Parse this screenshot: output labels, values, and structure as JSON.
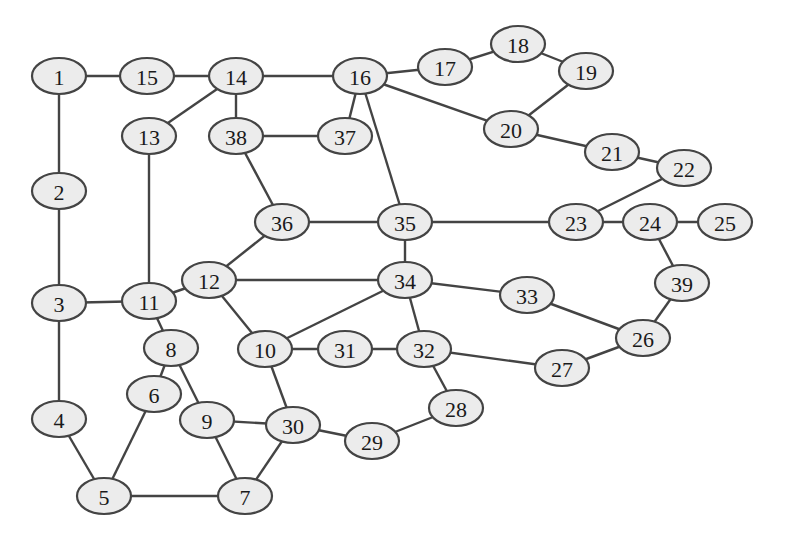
{
  "diagram": {
    "type": "undirected-graph",
    "node_style": {
      "fill": "#ececec",
      "stroke": "#444444",
      "rx": 27,
      "ry": 18
    },
    "edge_color": "#444444",
    "nodes": [
      {
        "id": "1",
        "label": "1",
        "x": 59,
        "y": 76
      },
      {
        "id": "2",
        "label": "2",
        "x": 59,
        "y": 191
      },
      {
        "id": "3",
        "label": "3",
        "x": 59,
        "y": 303
      },
      {
        "id": "4",
        "label": "4",
        "x": 59,
        "y": 419
      },
      {
        "id": "5",
        "label": "5",
        "x": 104,
        "y": 496
      },
      {
        "id": "6",
        "label": "6",
        "x": 154,
        "y": 394
      },
      {
        "id": "7",
        "label": "7",
        "x": 245,
        "y": 496
      },
      {
        "id": "8",
        "label": "8",
        "x": 171,
        "y": 348
      },
      {
        "id": "9",
        "label": "9",
        "x": 207,
        "y": 420
      },
      {
        "id": "10",
        "label": "10",
        "x": 265,
        "y": 349
      },
      {
        "id": "11",
        "label": "11",
        "x": 149,
        "y": 301
      },
      {
        "id": "12",
        "label": "12",
        "x": 209,
        "y": 280
      },
      {
        "id": "13",
        "label": "13",
        "x": 149,
        "y": 136
      },
      {
        "id": "14",
        "label": "14",
        "x": 236,
        "y": 76
      },
      {
        "id": "15",
        "label": "15",
        "x": 147,
        "y": 76
      },
      {
        "id": "16",
        "label": "16",
        "x": 360,
        "y": 76
      },
      {
        "id": "17",
        "label": "17",
        "x": 445,
        "y": 67
      },
      {
        "id": "18",
        "label": "18",
        "x": 518,
        "y": 44
      },
      {
        "id": "19",
        "label": "19",
        "x": 586,
        "y": 71
      },
      {
        "id": "20",
        "label": "20",
        "x": 511,
        "y": 129
      },
      {
        "id": "21",
        "label": "21",
        "x": 612,
        "y": 152
      },
      {
        "id": "22",
        "label": "22",
        "x": 684,
        "y": 168
      },
      {
        "id": "23",
        "label": "23",
        "x": 576,
        "y": 222
      },
      {
        "id": "24",
        "label": "24",
        "x": 650,
        "y": 222
      },
      {
        "id": "25",
        "label": "25",
        "x": 725,
        "y": 222
      },
      {
        "id": "26",
        "label": "26",
        "x": 643,
        "y": 338
      },
      {
        "id": "27",
        "label": "27",
        "x": 562,
        "y": 368
      },
      {
        "id": "28",
        "label": "28",
        "x": 456,
        "y": 408
      },
      {
        "id": "29",
        "label": "29",
        "x": 372,
        "y": 441
      },
      {
        "id": "30",
        "label": "30",
        "x": 293,
        "y": 425
      },
      {
        "id": "31",
        "label": "31",
        "x": 345,
        "y": 349
      },
      {
        "id": "32",
        "label": "32",
        "x": 424,
        "y": 349
      },
      {
        "id": "33",
        "label": "33",
        "x": 527,
        "y": 295
      },
      {
        "id": "34",
        "label": "34",
        "x": 405,
        "y": 280
      },
      {
        "id": "35",
        "label": "35",
        "x": 405,
        "y": 222
      },
      {
        "id": "36",
        "label": "36",
        "x": 282,
        "y": 222
      },
      {
        "id": "37",
        "label": "37",
        "x": 345,
        "y": 136
      },
      {
        "id": "38",
        "label": "38",
        "x": 236,
        "y": 136
      },
      {
        "id": "39",
        "label": "39",
        "x": 682,
        "y": 283
      }
    ],
    "edges": [
      [
        "1",
        "15"
      ],
      [
        "15",
        "14"
      ],
      [
        "14",
        "16"
      ],
      [
        "16",
        "17"
      ],
      [
        "17",
        "18"
      ],
      [
        "18",
        "19"
      ],
      [
        "19",
        "20"
      ],
      [
        "16",
        "20"
      ],
      [
        "20",
        "21"
      ],
      [
        "21",
        "22"
      ],
      [
        "22",
        "23"
      ],
      [
        "23",
        "24"
      ],
      [
        "24",
        "25"
      ],
      [
        "24",
        "39"
      ],
      [
        "39",
        "26"
      ],
      [
        "26",
        "33"
      ],
      [
        "26",
        "27"
      ],
      [
        "27",
        "32"
      ],
      [
        "33",
        "34"
      ],
      [
        "35",
        "23"
      ],
      [
        "16",
        "35"
      ],
      [
        "16",
        "37"
      ],
      [
        "37",
        "38"
      ],
      [
        "14",
        "38"
      ],
      [
        "14",
        "13"
      ],
      [
        "38",
        "36"
      ],
      [
        "36",
        "35"
      ],
      [
        "35",
        "34"
      ],
      [
        "36",
        "12"
      ],
      [
        "12",
        "34"
      ],
      [
        "12",
        "11"
      ],
      [
        "12",
        "10"
      ],
      [
        "10",
        "34"
      ],
      [
        "34",
        "32"
      ],
      [
        "10",
        "31"
      ],
      [
        "31",
        "32"
      ],
      [
        "32",
        "28"
      ],
      [
        "28",
        "29"
      ],
      [
        "29",
        "30"
      ],
      [
        "10",
        "30"
      ],
      [
        "30",
        "9"
      ],
      [
        "30",
        "7"
      ],
      [
        "9",
        "7"
      ],
      [
        "8",
        "9"
      ],
      [
        "11",
        "8"
      ],
      [
        "8",
        "6"
      ],
      [
        "6",
        "5"
      ],
      [
        "5",
        "7"
      ],
      [
        "4",
        "5"
      ],
      [
        "3",
        "4"
      ],
      [
        "3",
        "11"
      ],
      [
        "2",
        "3"
      ],
      [
        "1",
        "2"
      ],
      [
        "13",
        "11"
      ]
    ]
  }
}
